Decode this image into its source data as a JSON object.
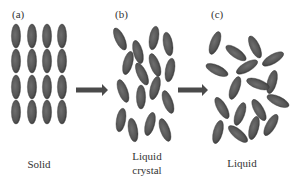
{
  "figure": {
    "panels": [
      {
        "id": "a",
        "label": "(a)",
        "caption_lines": [
          "Solid"
        ]
      },
      {
        "id": "b",
        "label": "(b)",
        "caption_lines": [
          "Liquid",
          "crystal"
        ]
      },
      {
        "id": "c",
        "label": "(c)",
        "caption_lines": [
          "Liquid"
        ]
      }
    ],
    "colors": {
      "molecule_fill": "#5c5c5c",
      "molecule_edge": "#3e3e3e",
      "arrow": "#4a4a4a",
      "text": "#333333"
    },
    "molecules": {
      "solid": [
        [
          16,
          36,
          0
        ],
        [
          32,
          36,
          0
        ],
        [
          47,
          36,
          0
        ],
        [
          62,
          36,
          0
        ],
        [
          16,
          61,
          0
        ],
        [
          32,
          61,
          0
        ],
        [
          47,
          61,
          0
        ],
        [
          62,
          61,
          0
        ],
        [
          16,
          87,
          0
        ],
        [
          32,
          87,
          0
        ],
        [
          47,
          87,
          0
        ],
        [
          62,
          87,
          0
        ],
        [
          16,
          112,
          0
        ],
        [
          32,
          112,
          0
        ],
        [
          47,
          112,
          0
        ],
        [
          62,
          112,
          0
        ]
      ],
      "liquid_crystal": [
        [
          120,
          39,
          -25
        ],
        [
          138,
          52,
          -15
        ],
        [
          154,
          38,
          10
        ],
        [
          168,
          44,
          -10
        ],
        [
          128,
          63,
          15
        ],
        [
          142,
          74,
          -25
        ],
        [
          155,
          65,
          -20
        ],
        [
          170,
          70,
          10
        ],
        [
          123,
          91,
          -20
        ],
        [
          141,
          97,
          0
        ],
        [
          155,
          88,
          15
        ],
        [
          168,
          102,
          -20
        ],
        [
          121,
          120,
          10
        ],
        [
          133,
          130,
          -10
        ],
        [
          150,
          124,
          15
        ],
        [
          165,
          130,
          -20
        ]
      ],
      "liquid": [
        [
          215,
          43,
          20
        ],
        [
          236,
          53,
          -55
        ],
        [
          255,
          47,
          -25
        ],
        [
          273,
          59,
          60
        ],
        [
          217,
          70,
          -65
        ],
        [
          247,
          67,
          60
        ],
        [
          272,
          82,
          15
        ],
        [
          235,
          88,
          20
        ],
        [
          258,
          84,
          -70
        ],
        [
          222,
          108,
          -30
        ],
        [
          240,
          114,
          20
        ],
        [
          259,
          110,
          -30
        ],
        [
          278,
          101,
          -65
        ],
        [
          218,
          132,
          15
        ],
        [
          238,
          134,
          -50
        ],
        [
          254,
          128,
          15
        ],
        [
          271,
          125,
          30
        ]
      ]
    },
    "arrows": [
      {
        "from": "a",
        "to": "b",
        "x1": 76,
        "x2": 108,
        "y": 90
      },
      {
        "from": "b",
        "to": "c",
        "x1": 178,
        "x2": 208,
        "y": 90
      }
    ]
  }
}
